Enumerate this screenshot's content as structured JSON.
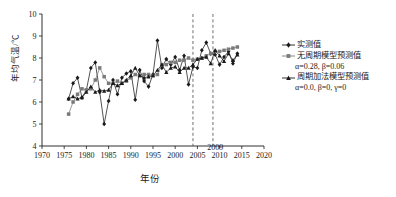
{
  "chart_data": {
    "type": "line",
    "title": "",
    "xlabel": "年份",
    "ylabel": "年均气温/℃",
    "xlim": [
      1970,
      2020
    ],
    "ylim": [
      4,
      10
    ],
    "xticks": [
      1970,
      1975,
      1980,
      1985,
      1990,
      1995,
      2000,
      2005,
      2010,
      2015,
      2020
    ],
    "yticks": [
      4,
      5,
      6,
      7,
      8,
      9,
      10
    ],
    "grid": false,
    "legend_position": "right",
    "annotations": [
      {
        "text": "2009",
        "x": 2009,
        "y": 4,
        "type": "axis-label"
      },
      {
        "text": "",
        "x": 2004.0,
        "type": "vline",
        "style": "dashed"
      },
      {
        "text": "",
        "x": 2008.5,
        "type": "vline",
        "style": "dashed"
      }
    ],
    "series": [
      {
        "name": "实测值",
        "marker": "diamond",
        "color": "#1a1a1a",
        "x": [
          1976,
          1977,
          1978,
          1979,
          1980,
          1981,
          1982,
          1983,
          1984,
          1985,
          1986,
          1987,
          1988,
          1989,
          1990,
          1991,
          1992,
          1993,
          1994,
          1995,
          1996,
          1997,
          1998,
          1999,
          2000,
          2001,
          2002,
          2003,
          2004,
          2005,
          2006,
          2007,
          2008,
          2009,
          2010,
          2011,
          2012,
          2013,
          2014
        ],
        "y": [
          6.15,
          6.85,
          7.1,
          6.2,
          6.55,
          7.55,
          7.8,
          6.45,
          5.0,
          6.05,
          7.0,
          6.35,
          7.1,
          7.3,
          7.4,
          6.1,
          7.45,
          6.95,
          6.7,
          7.25,
          8.8,
          7.55,
          7.95,
          7.7,
          8.05,
          7.45,
          8.1,
          6.8,
          7.6,
          7.55,
          8.35,
          8.7,
          8.2,
          8.15,
          7.7,
          8.05,
          8.3,
          7.75,
          8.2
        ]
      },
      {
        "name": "无周期模型预测值",
        "params": "α=0.28, β=0.06",
        "marker": "square",
        "color": "#7a7a7a",
        "x": [
          1976,
          1977,
          1978,
          1979,
          1980,
          1981,
          1982,
          1983,
          1984,
          1985,
          1986,
          1987,
          1988,
          1989,
          1990,
          1991,
          1992,
          1993,
          1994,
          1995,
          1996,
          1997,
          1998,
          1999,
          2000,
          2001,
          2002,
          2003,
          2004,
          2005,
          2006,
          2007,
          2008,
          2009,
          2010,
          2011,
          2012,
          2013,
          2014
        ],
        "y": [
          5.45,
          6.0,
          6.35,
          6.6,
          6.55,
          6.6,
          7.0,
          7.55,
          7.15,
          6.85,
          6.85,
          6.95,
          6.85,
          6.95,
          7.1,
          7.25,
          7.2,
          7.25,
          7.25,
          7.2,
          7.25,
          7.7,
          7.7,
          7.8,
          7.8,
          7.9,
          7.9,
          8.0,
          7.9,
          7.95,
          8.0,
          8.1,
          8.2,
          8.3,
          8.3,
          8.35,
          8.4,
          8.45,
          8.5
        ]
      },
      {
        "name": "周期加法模型预测值",
        "params": "α=0.0, β=0, γ=0",
        "marker": "triangle",
        "color": "#1a1a1a",
        "x": [
          1976,
          1977,
          1978,
          1979,
          1980,
          1981,
          1982,
          1983,
          1984,
          1985,
          1986,
          1987,
          1988,
          1989,
          1990,
          1991,
          1992,
          1993,
          1994,
          1995,
          1996,
          1997,
          1998,
          1999,
          2000,
          2001,
          2002,
          2003,
          2004,
          2005,
          2006,
          2007,
          2008,
          2009,
          2010,
          2011,
          2012,
          2013,
          2014
        ],
        "y": [
          6.15,
          6.25,
          6.15,
          6.2,
          6.45,
          6.7,
          6.45,
          6.55,
          6.5,
          6.55,
          6.85,
          6.75,
          6.85,
          7.0,
          7.2,
          7.55,
          7.2,
          7.1,
          7.15,
          7.2,
          7.45,
          7.7,
          7.35,
          7.55,
          7.6,
          7.35,
          7.55,
          7.55,
          7.7,
          7.95,
          8.0,
          8.05,
          7.75,
          8.35,
          8.1,
          7.85,
          8.2,
          7.9,
          8.15
        ]
      }
    ]
  },
  "legend": {
    "items": [
      {
        "label": "实测值",
        "params": ""
      },
      {
        "label": "无周期模型预测值",
        "params": "α=0.28, β=0.06"
      },
      {
        "label": "周期加法模型预测值",
        "params": "α=0.0, β=0, γ=0"
      }
    ]
  },
  "axis": {
    "y_title": "年均气温/℃",
    "x_title": "年份",
    "callout_year": "2009"
  }
}
